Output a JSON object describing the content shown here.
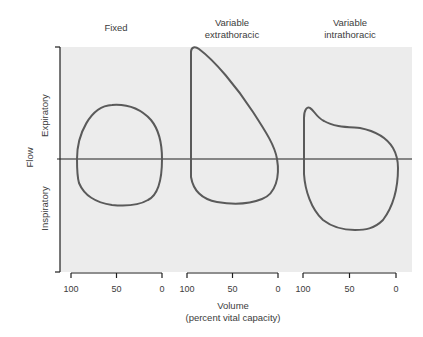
{
  "diagram": {
    "panels": [
      {
        "title": "Fixed",
        "ticks": [
          "100",
          "50",
          "0"
        ]
      },
      {
        "title": "Variable\nextrathoracic",
        "ticks": [
          "100",
          "50",
          "0"
        ]
      },
      {
        "title": "Variable\nintrathoracic",
        "ticks": [
          "100",
          "50",
          "0"
        ]
      }
    ],
    "y_axis": {
      "title": "Flow",
      "upper_label": "Expiratory",
      "lower_label": "Inspiratory"
    },
    "x_axis": {
      "title": "Volume",
      "subtitle": "(percent vital capacity)"
    },
    "colors": {
      "panel_background": "#ececec",
      "curve": "#5a5a5a",
      "axis": "#1e1e1e"
    }
  }
}
